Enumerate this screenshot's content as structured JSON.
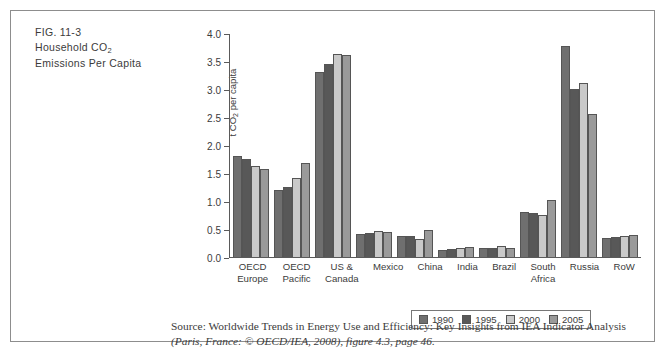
{
  "figure": {
    "number": "FIG. 11-3",
    "title_line1": "Household CO",
    "title_sub": "2",
    "title_line2": "Emissions Per Capita"
  },
  "source": {
    "line1": "Source: Worldwide Trends in Energy Use and Efficiency: Key Insights from IEA Indicator Analysis",
    "line2": "(Paris, France: © OECD/IEA, 2008), figure 4.3, page 46."
  },
  "colors": {
    "series_1990": "#6f6f6f",
    "series_1995": "#585858",
    "series_2000": "#c9c9c9",
    "series_2005": "#9a9a9a",
    "axis": "#5a5a5a",
    "text": "#3b3b3b",
    "frame": "#8d8d8d"
  },
  "chart_data": {
    "type": "bar",
    "title": "Household CO2 Emissions Per Capita",
    "xlabel": "",
    "ylabel": "t CO2 per capita",
    "ylim": [
      0.0,
      4.0
    ],
    "ytick_labels": [
      "0.0",
      "0.5",
      "1.0",
      "1.5",
      "2.0",
      "2.5",
      "3.0",
      "3.5",
      "4.0"
    ],
    "ytick_values": [
      0.0,
      0.5,
      1.0,
      1.5,
      2.0,
      2.5,
      3.0,
      3.5,
      4.0
    ],
    "grid": false,
    "legend_position": "bottom",
    "categories": [
      "OECD Europe",
      "OECD Pacific",
      "US & Canada",
      "Mexico",
      "China",
      "India",
      "Brazil",
      "South Africa",
      "Russia",
      "RoW"
    ],
    "category_lines": [
      [
        "OECD",
        "Europe"
      ],
      [
        "OECD",
        "Pacific"
      ],
      [
        "US &",
        "Canada"
      ],
      [
        "Mexico"
      ],
      [
        "China"
      ],
      [
        "India"
      ],
      [
        "Brazil"
      ],
      [
        "South",
        "Africa"
      ],
      [
        "Russia"
      ],
      [
        "RoW"
      ]
    ],
    "series": [
      {
        "name": "1990",
        "color": "#6f6f6f",
        "values": [
          1.82,
          1.21,
          3.31,
          0.41,
          0.38,
          0.13,
          0.16,
          0.8,
          3.78,
          0.35
        ]
      },
      {
        "name": "1995",
        "color": "#585858",
        "values": [
          1.75,
          1.25,
          3.46,
          0.43,
          0.38,
          0.15,
          0.16,
          0.79,
          3.02,
          0.36
        ]
      },
      {
        "name": "2000",
        "color": "#c9c9c9",
        "values": [
          1.63,
          1.42,
          3.65,
          0.46,
          0.33,
          0.17,
          0.19,
          0.75,
          3.12,
          0.38
        ]
      },
      {
        "name": "2005",
        "color": "#9a9a9a",
        "values": [
          1.58,
          1.69,
          3.63,
          0.44,
          0.49,
          0.18,
          0.17,
          1.03,
          2.57,
          0.4
        ]
      }
    ]
  }
}
